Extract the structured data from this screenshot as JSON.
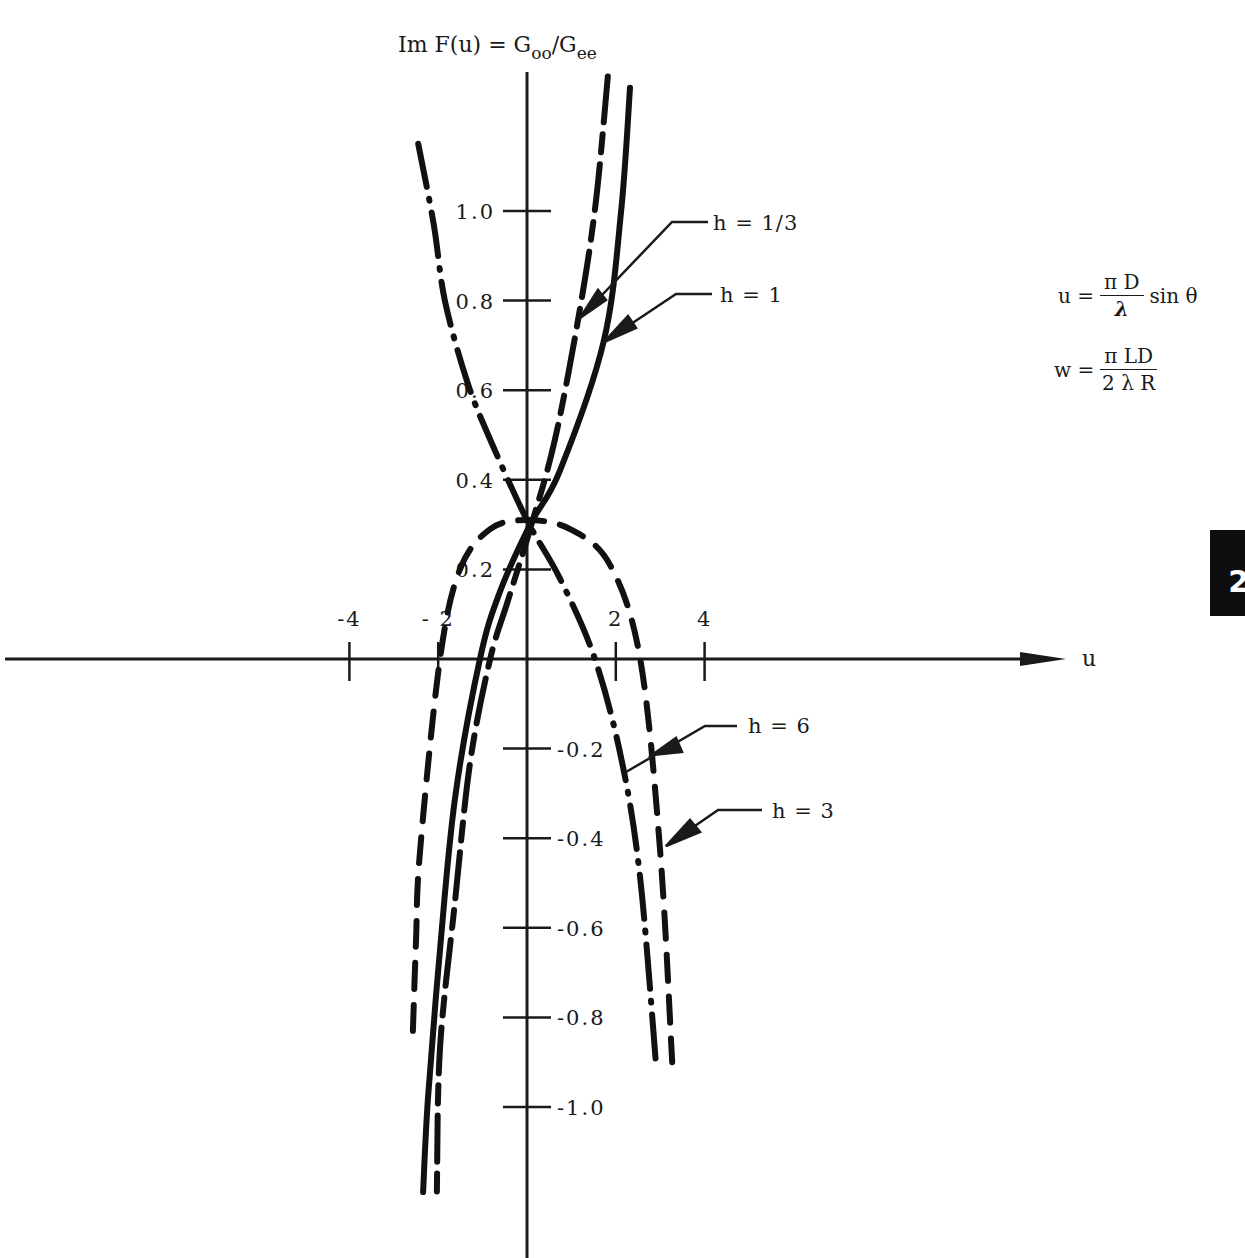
{
  "chart_data": {
    "type": "line",
    "title": "",
    "xlabel": "u",
    "ylabel": "Im F(u) = G_oo / G_ee",
    "ylabel_parts": {
      "main": "Im F(u) = G",
      "sub1": "oo",
      "slash": "/G",
      "sub2": "ee"
    },
    "xlim": [
      -5.9,
      12.1
    ],
    "ylim": [
      -1.33,
      1.42
    ],
    "grid": false,
    "x_ticks": [
      {
        "value": -4,
        "label": "-4"
      },
      {
        "value": -2,
        "label": "- 2"
      },
      {
        "value": 2,
        "label": "2"
      },
      {
        "value": 4,
        "label": "4"
      }
    ],
    "y_ticks": [
      {
        "value": 1.0,
        "label": "1.0"
      },
      {
        "value": 0.8,
        "label": "0.8"
      },
      {
        "value": 0.6,
        "label": "0.6"
      },
      {
        "value": 0.4,
        "label": "0.4"
      },
      {
        "value": 0.2,
        "label": "0.2"
      },
      {
        "value": -0.2,
        "label": "-0.2"
      },
      {
        "value": -0.4,
        "label": "-0.4"
      },
      {
        "value": -0.6,
        "label": "-0.6"
      },
      {
        "value": -0.8,
        "label": "-0.8"
      },
      {
        "value": -1.0,
        "label": "-1.0"
      }
    ],
    "series": [
      {
        "name": "h = 1/3",
        "style": "dash-dash-long",
        "x": [
          1.82,
          1.55,
          1.19,
          0.63,
          0.07,
          -0.43,
          -0.83,
          -1.28,
          -1.62,
          -1.96,
          -2.03
        ],
        "y": [
          1.3,
          1.02,
          0.78,
          0.49,
          0.29,
          0.13,
          0.0,
          -0.23,
          -0.54,
          -0.87,
          -1.19
        ]
      },
      {
        "name": "h = 1",
        "style": "solid",
        "x": [
          2.32,
          2.12,
          1.73,
          0.74,
          0.07,
          -0.61,
          -1.06,
          -1.62,
          -1.96,
          -2.23,
          -2.34
        ],
        "y": [
          1.275,
          1.0,
          0.71,
          0.42,
          0.3,
          0.15,
          0.0,
          -0.31,
          -0.65,
          -0.98,
          -1.19
        ]
      },
      {
        "name": "h = 6",
        "style": "long-dash-dot",
        "x": [
          -2.45,
          -2.1,
          -1.85,
          -1.35,
          -0.83,
          0.0,
          0.74,
          1.53,
          2.14,
          2.55,
          2.91
        ],
        "y": [
          1.15,
          0.97,
          0.8,
          0.62,
          0.49,
          0.31,
          0.18,
          0.0,
          -0.23,
          -0.49,
          -0.91
        ]
      },
      {
        "name": "h = 3",
        "style": "dashed",
        "x": [
          -2.57,
          -2.5,
          -2.41,
          -1.96,
          -1.51,
          -0.83,
          0.0,
          0.97,
          1.87,
          2.55,
          3.0,
          3.27
        ],
        "y": [
          -0.83,
          -0.63,
          -0.43,
          0.0,
          0.2,
          0.29,
          0.31,
          0.29,
          0.21,
          0.0,
          -0.43,
          -0.9
        ]
      }
    ],
    "annotations": [
      {
        "label": "h = 1/3",
        "target_series": "h = 1/3"
      },
      {
        "label": "h = 1",
        "target_series": "h = 1"
      },
      {
        "label": "h = 6",
        "target_series": "h = 6"
      },
      {
        "label": "h = 3",
        "target_series": "h = 3"
      }
    ]
  },
  "formulas": {
    "u": {
      "lhs": "u =",
      "num": "π D",
      "den": "λ",
      "tail": "sin θ"
    },
    "w": {
      "lhs": "w =",
      "num": "π LD",
      "den": "2 λ R"
    }
  },
  "page_tab": {
    "label": "2"
  }
}
